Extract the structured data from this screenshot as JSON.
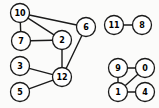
{
  "figure": {
    "width": 159,
    "height": 108,
    "background_color": "#fbfbfa",
    "node_fill_color": "#ffffff",
    "node_stroke_color": "#1a1a1a",
    "edge_color": "#1a1a1a",
    "label_color": "#000000",
    "node_radius": 9.5
  },
  "graph": {
    "type": "undirected",
    "node_count": 13,
    "edge_count": 12,
    "component_count": 3,
    "nodes": [
      {
        "id": "10",
        "label": "10",
        "x": 20,
        "y": 13
      },
      {
        "id": "7",
        "label": "7",
        "x": 21,
        "y": 41
      },
      {
        "id": "2",
        "label": "2",
        "x": 62,
        "y": 40
      },
      {
        "id": "6",
        "label": "6",
        "x": 86,
        "y": 27
      },
      {
        "id": "3",
        "label": "3",
        "x": 20,
        "y": 66
      },
      {
        "id": "12",
        "label": "12",
        "x": 62,
        "y": 77
      },
      {
        "id": "5",
        "label": "5",
        "x": 20,
        "y": 92
      },
      {
        "id": "11",
        "label": "11",
        "x": 114,
        "y": 25
      },
      {
        "id": "8",
        "label": "8",
        "x": 142,
        "y": 25
      },
      {
        "id": "9",
        "label": "9",
        "x": 118,
        "y": 68
      },
      {
        "id": "0",
        "label": "0",
        "x": 145,
        "y": 68
      },
      {
        "id": "1",
        "label": "1",
        "x": 118,
        "y": 92
      },
      {
        "id": "4",
        "label": "4",
        "x": 145,
        "y": 92
      }
    ],
    "edges": [
      {
        "source": "10",
        "target": "7"
      },
      {
        "source": "10",
        "target": "2"
      },
      {
        "source": "10",
        "target": "6"
      },
      {
        "source": "7",
        "target": "2"
      },
      {
        "source": "2",
        "target": "12"
      },
      {
        "source": "6",
        "target": "12"
      },
      {
        "source": "3",
        "target": "12"
      },
      {
        "source": "5",
        "target": "12"
      },
      {
        "source": "11",
        "target": "8"
      },
      {
        "source": "9",
        "target": "0"
      },
      {
        "source": "9",
        "target": "1"
      },
      {
        "source": "0",
        "target": "1"
      },
      {
        "source": "1",
        "target": "4"
      }
    ],
    "components": [
      {
        "name": "component-1",
        "nodes": [
          "10",
          "7",
          "2",
          "6",
          "3",
          "12",
          "5"
        ]
      },
      {
        "name": "component-2",
        "nodes": [
          "11",
          "8"
        ]
      },
      {
        "name": "component-3",
        "nodes": [
          "9",
          "0",
          "1",
          "4"
        ]
      }
    ]
  }
}
